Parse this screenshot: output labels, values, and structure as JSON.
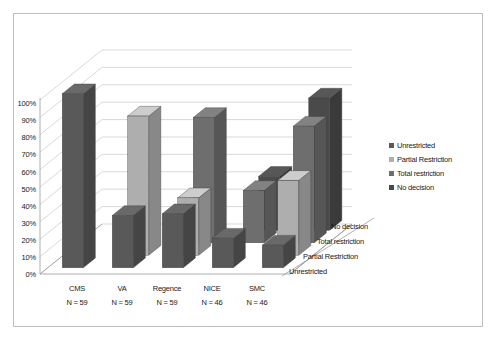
{
  "chart_data": {
    "type": "bar",
    "title": "",
    "xlabel": "",
    "ylabel": "",
    "ylim": [
      0,
      100
    ],
    "grid": true,
    "legend_position": "right",
    "three_d": true,
    "ytick_labels": [
      "100%",
      "90%",
      "80%",
      "70%",
      "60%",
      "50%",
      "40%",
      "30%",
      "20%",
      "10%",
      "0%"
    ],
    "yticks": [
      100,
      90,
      80,
      70,
      60,
      50,
      40,
      30,
      20,
      10,
      0
    ],
    "categories": [
      "CMS",
      "VA",
      "Regence",
      "NICE",
      "SMC"
    ],
    "category_sublabels": [
      "N = 59",
      "N = 59",
      "N = 59",
      "N = 46",
      "N = 46"
    ],
    "depth_categories": [
      "Unrestricted",
      "Partial Restriction",
      "Total restriction",
      "No decision"
    ],
    "series": [
      {
        "name": "Unrestricted",
        "color": "#595959",
        "values": [
          100,
          30,
          31,
          17,
          13
        ]
      },
      {
        "name": "Partial Restriction",
        "color": "#aeaeae",
        "values": [
          0,
          80,
          33,
          0,
          43
        ]
      },
      {
        "name": "Total restriction",
        "color": "#6e6e6e",
        "values": [
          0,
          0,
          72,
          30,
          67
        ]
      },
      {
        "name": "No decision",
        "color": "#4a4a4a",
        "values": [
          0,
          0,
          0,
          31,
          76
        ]
      }
    ]
  },
  "legend": {
    "items": [
      {
        "label": "Unrestricted",
        "color": "#595959"
      },
      {
        "label": "Partial Restriction",
        "color": "#aeaeae"
      },
      {
        "label": "Total restriction",
        "color": "#6e6e6e"
      },
      {
        "label": "No decision",
        "color": "#4a4a4a"
      }
    ]
  },
  "axes": {
    "y": {
      "t100": "100%",
      "t90": "90%",
      "t80": "80%",
      "t70": "70%",
      "t60": "60%",
      "t50": "50%",
      "t40": "40%",
      "t30": "30%",
      "t20": "20%",
      "t10": "10%",
      "t0": "0%"
    },
    "x": {
      "c0": "CMS",
      "c1": "VA",
      "c2": "Regence",
      "c3": "NICE",
      "c4": "SMC",
      "s0": "N = 59",
      "s1": "N = 59",
      "s2": "N = 59",
      "s3": "N = 46",
      "s4": "N = 46"
    },
    "z": {
      "d0": "Unrestricted",
      "d1": "Partial Restriction",
      "d2": "Total restriction",
      "d3": "No decision"
    }
  }
}
